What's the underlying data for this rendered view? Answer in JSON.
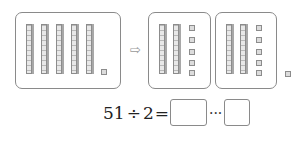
{
  "diagram": {
    "left_group": {
      "tens_rods": 5,
      "ones_cubes": 1
    },
    "arrow_icon": "⇨",
    "divided_groups": [
      {
        "tens_rods": 2,
        "ones_cubes": 5
      },
      {
        "tens_rods": 2,
        "ones_cubes": 5
      }
    ],
    "remainder_cubes": 1
  },
  "equation": {
    "dividend": "51",
    "operator": "÷",
    "divisor": "2",
    "equals": "=",
    "quotient_box": "",
    "remainder_separator": "···",
    "remainder_box": ""
  }
}
